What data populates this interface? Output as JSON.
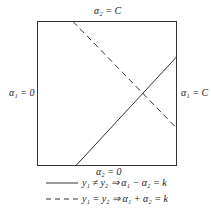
{
  "diagram": {
    "labels": {
      "top": "α₂ = C",
      "bottom": "α₂ = 0",
      "left": "α₁ = 0",
      "right": "α₁ = C"
    },
    "legend": [
      {
        "style": "solid",
        "text": "y₁ ≠ y₂ ⇒ α₁ − α₂ = k"
      },
      {
        "style": "dashed",
        "text": "y₁ = y₂ ⇒ α₁ + α₂ = k"
      }
    ],
    "lines": {
      "solid": {
        "from": [
          76,
          166
        ],
        "to": [
          177,
          57
        ]
      },
      "dashed": {
        "from": [
          73,
          21
        ],
        "to": [
          177,
          128
        ]
      }
    },
    "box": {
      "x": 37,
      "y": 21,
      "width": 140,
      "height": 145
    }
  }
}
